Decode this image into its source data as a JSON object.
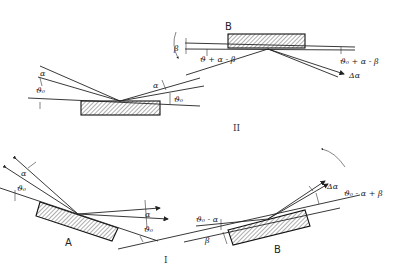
{
  "diagram": {
    "panel_II": {
      "label": "II",
      "left_crystal": {
        "angle_labels": [
          "α",
          "ϑ₀",
          "α",
          "ϑ₀"
        ]
      },
      "right_crystal": {
        "label": "B",
        "angle_labels": [
          "β",
          "ϑ + α - β",
          "ϑ₀ + α - β",
          "Δα"
        ]
      }
    },
    "panel_I": {
      "label": "I",
      "crystal_A": {
        "label": "A",
        "angle_labels": [
          "α",
          "ϑ₀",
          "α",
          "ϑ₀"
        ]
      },
      "crystal_B": {
        "label": "B",
        "angle_labels": [
          "ϑ₀ - α",
          "β",
          "Δα",
          "ϑ₀ - α + β"
        ]
      }
    }
  }
}
